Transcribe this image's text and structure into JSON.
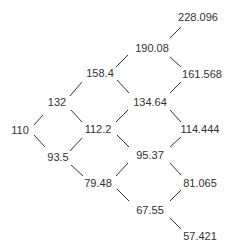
{
  "diagram": {
    "type": "binomial-tree",
    "nodes": [
      {
        "id": "n0",
        "label": "110",
        "x": 20,
        "y": 130
      },
      {
        "id": "n1u",
        "label": "132",
        "x": 57,
        "y": 102
      },
      {
        "id": "n1d",
        "label": "93.5",
        "x": 58,
        "y": 157
      },
      {
        "id": "n2u",
        "label": "158.4",
        "x": 100,
        "y": 73
      },
      {
        "id": "n2m",
        "label": "112.2",
        "x": 98,
        "y": 129
      },
      {
        "id": "n2d",
        "label": "79.48",
        "x": 98,
        "y": 183
      },
      {
        "id": "n3u",
        "label": "190.08",
        "x": 152,
        "y": 48
      },
      {
        "id": "n3m1",
        "label": "134.64",
        "x": 150,
        "y": 102
      },
      {
        "id": "n3m2",
        "label": "95.37",
        "x": 150,
        "y": 155
      },
      {
        "id": "n3d",
        "label": "67.55",
        "x": 150,
        "y": 210
      },
      {
        "id": "n4a",
        "label": "228.096",
        "x": 198,
        "y": 17
      },
      {
        "id": "n4b",
        "label": "161.568",
        "x": 202,
        "y": 74
      },
      {
        "id": "n4c",
        "label": "114.444",
        "x": 200,
        "y": 129
      },
      {
        "id": "n4d",
        "label": "81.065",
        "x": 200,
        "y": 183
      },
      {
        "id": "n4e",
        "label": "57.421",
        "x": 200,
        "y": 236
      }
    ],
    "line_color": "#333333"
  }
}
